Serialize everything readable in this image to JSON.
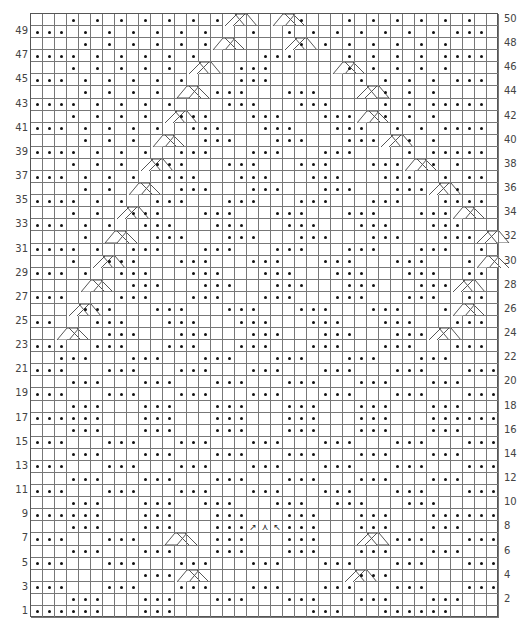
{
  "chart": {
    "type": "knitting-chart",
    "columns": 39,
    "rows_count": 50,
    "legend": {
      ".": "purl",
      " ": "knit",
      "C": "cable-cross-left (2 sts)",
      "D": "cable-cross-right (2 sts)"
    },
    "left_row_numbers": [
      "49",
      "47",
      "45",
      "43",
      "41",
      "39",
      "37",
      "35",
      "33",
      "31",
      "29",
      "27",
      "25",
      "23",
      "21",
      "19",
      "17",
      "15",
      "13",
      "11",
      "9",
      "7",
      "5",
      "3",
      "1"
    ],
    "right_row_numbers": [
      "50",
      "48",
      "46",
      "44",
      "42",
      "40",
      "38",
      "36",
      "34",
      "32",
      "30",
      "28",
      "26",
      "24",
      "22",
      "20",
      "18",
      "16",
      "14",
      "12",
      "10",
      "8",
      "6",
      "4",
      "2"
    ],
    "center_symbols_row8": [
      "↗",
      "⋏",
      "↖"
    ],
    "rows": [
      "   . . . . . . .D   C .   . . . . . .  ",
      "... . . . . . .   .  . . . . . . . ...",
      "    . . . . . .C     D. . . . . . .   ",
      ".... . . . . .     ...    . . . . ....",
      "   . . . . . D   ...     C. . . . .   ",
      "... . . . . .    ...       . . . . ...",
      "    . . . . C  ...   ...   D . . .    ",
      ".... . . . .    ...   ...    . . .....",
      "   . . . . D...   ...   ...C . . .    ",
      "... . . . .  ...   ...   ...  . . ....",
      "    . . . C   ...   ...   ...D . .    ",
      ".... . . .  ...   ...   ...    . .....",
      "   . . . D...   ...   ...   ...C . .  ",
      "... . . .  ...   ...   ...   ...  . ..",
      "    . . C   ...   ...   ...   ...D .  ",
      ".... . .  ...   ...   ...   ...   ....",
      "   . . D...   ...   ...   ...   ...C  ",
      "... . .  ...   ...   ...   ...   ...  ",
      "    . C   ...   ...   ...   ...   ...D",
      ".... .  ...   ...   ...   ...   ...  .",
      "   . D...   ...   ...   ...   ...   .C",
      "... .  ...   ...   ...   ...   ...  ..",
      "    C   ...   ...   ...   ...   ...D  ",
      "...    ...   ...   ...   ...   ...  ..",
      "   D...   ...   ...   ...   ...   .C  ",
      "..   ...   ...   ...   ...   ...   ...",
      "  C   ...   ...   ...   ...   ...D   ",
      "...  ...   ...   ...   ...   ...   ...",
      "  ...   ...   ...   ...   ...   ...   ",
      "...   ...   ...   ...   ...   ...   ...",
      "   ...   ...   ...   ...   ...   ...  ",
      "...   ...   ...   ...   ...   ...   ...",
      "   ...   ...   ...   ...   ...   ...  ",
      "......   ...   ...   ...   ...   ......",
      "   ...   ...   ...   ...   ...   ...  ",
      "...   ...   ...   ...   ...   ...   ...",
      "   ...   ...   ...   ...   ...   ...  ",
      "...   ...   ...   ...   ...   ...   ...",
      "   ...   ...   ...   ...   ...   ...  ",
      "...   ...   ...   ...   ...   ...   ...",
      "   ...   ...  ...   ...  ...   ...    ",
      "......   ...   ...   ...   ...   ......",
      "   ...   ...   ...   ...   ...   ...  ",
      "...   ...  C   ...   ...   D  ...   ...",
      "   ...   ...   ...   ...   ...   ...  ",
      "...   ...   ...   ...   ...   ...   ...",
      "         ...C             D...        ",
      "...   ...   ...   ...   ...   ...   ...",
      "   ...   ...   ...   ...   ...   ...  ",
      "......   ...           ...   ......   "
    ]
  }
}
